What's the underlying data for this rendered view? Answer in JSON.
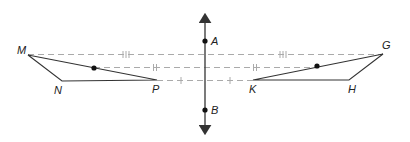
{
  "diagram": {
    "type": "reflection-geometry",
    "axis": {
      "label_top": "A",
      "label_bottom": "B",
      "x": 205,
      "y_top": 12,
      "y_bottom": 136,
      "A_y": 41,
      "B_y": 110
    },
    "left_triangle": {
      "vertices": {
        "M": [
          28,
          55
        ],
        "N": [
          62,
          81
        ],
        "P": [
          157,
          80
        ]
      },
      "labels": {
        "M": "M",
        "N": "N",
        "P": "P"
      },
      "midpoint_dot": [
        94,
        68
      ]
    },
    "right_triangle": {
      "vertices": {
        "G": [
          383,
          54
        ],
        "H": [
          349,
          80
        ],
        "K": [
          253,
          80
        ]
      },
      "labels": {
        "G": "G",
        "H": "H",
        "K": "K"
      },
      "midpoint_dot": [
        317,
        66
      ]
    },
    "dashed_lines": [
      {
        "y": 54,
        "from_x": 28,
        "to_x": 383,
        "tick_marks": 3,
        "tick_x": [
          126,
          283
        ]
      },
      {
        "y": 67,
        "from_x": 94,
        "to_x": 317,
        "tick_marks": 2,
        "tick_x": [
          155,
          255
        ]
      },
      {
        "y": 80,
        "from_x": 157,
        "to_x": 253,
        "tick_marks": 1,
        "tick_x": [
          181,
          230
        ]
      }
    ],
    "colors": {
      "line": "#333333",
      "dash": "#aaaaaa",
      "point": "#111111"
    }
  },
  "labels": {
    "A": "A",
    "B": "B",
    "M": "M",
    "N": "N",
    "P": "P",
    "G": "G",
    "H": "H",
    "K": "K"
  }
}
